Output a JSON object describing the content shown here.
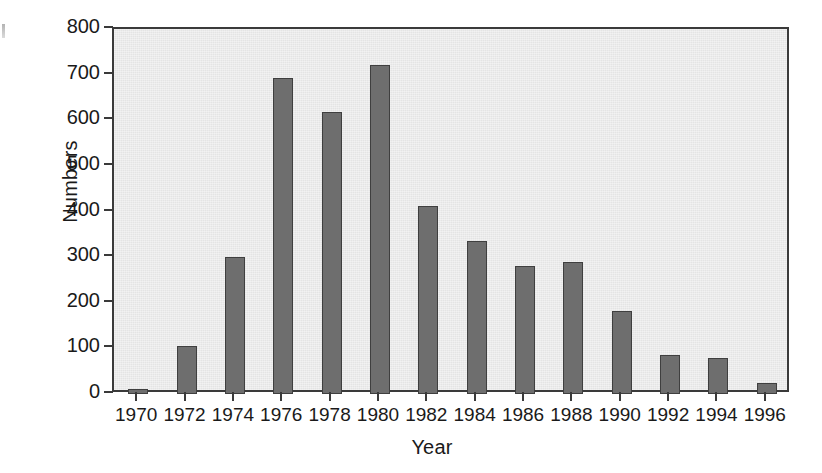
{
  "chart_data": {
    "type": "bar",
    "title": "",
    "xlabel": "Year",
    "ylabel": "Numbers",
    "categories": [
      "1970",
      "1972",
      "1974",
      "1976",
      "1978",
      "1980",
      "1982",
      "1984",
      "1986",
      "1988",
      "1990",
      "1992",
      "1994",
      "1996"
    ],
    "values": [
      10,
      105,
      300,
      693,
      618,
      722,
      412,
      335,
      280,
      289,
      182,
      85,
      80,
      25
    ],
    "ylim": [
      0,
      800
    ],
    "yticks": [
      0,
      100,
      200,
      300,
      400,
      500,
      600,
      700,
      800
    ],
    "ytick_labels": [
      "0",
      "100",
      "200",
      "300",
      "400",
      "500",
      "600",
      "700",
      "800"
    ],
    "grid": false,
    "legend": null,
    "bar_color": "#6e6e6e",
    "bar_edge_color": "#3f3f3f",
    "plot_background": "#e4e4e4",
    "axis_color": "#3a3a3a"
  }
}
